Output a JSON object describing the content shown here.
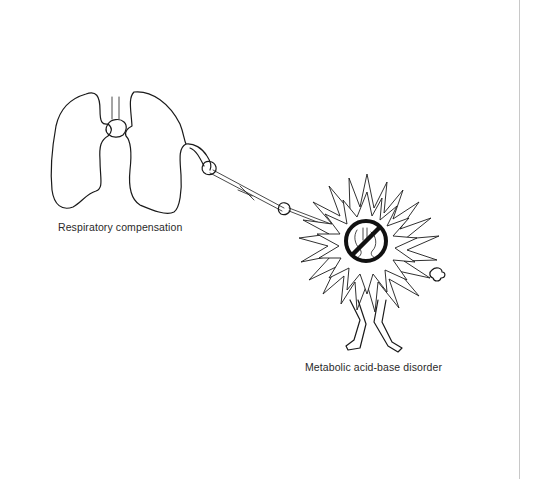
{
  "figure": {
    "labels": {
      "lungs": "Respiratory compensation",
      "creature": "Metabolic acid-base disorder"
    },
    "elements": {
      "lungs": "lungs-illustration",
      "sword": "fencing-sword",
      "creature": "spiky-creature",
      "symbol": "no-kidney-symbol"
    },
    "colors": {
      "ink": "#1a1a1a",
      "background": "#ffffff",
      "page_edge": "#c8c8c8"
    }
  }
}
